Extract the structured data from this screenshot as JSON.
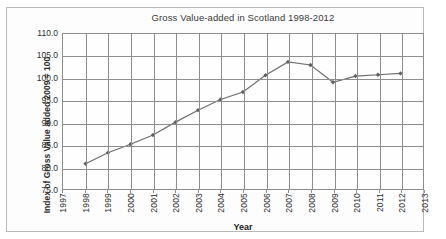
{
  "chart_data": {
    "type": "line",
    "title": "Gross Value-added in Scotland 1998-2012",
    "xlabel": "Year",
    "ylabel": "Index of Gross Value added 2009 = 100",
    "x": [
      1998,
      1999,
      2000,
      2001,
      2002,
      2003,
      2004,
      2005,
      2006,
      2007,
      2008,
      2009,
      2010,
      2011,
      2012
    ],
    "values": [
      80.7,
      83.2,
      85.1,
      87.2,
      90.1,
      92.8,
      95.2,
      96.9,
      100.7,
      103.7,
      103.0,
      99.1,
      100.5,
      100.8,
      101.1
    ],
    "series": [
      {
        "name": "Index of Gross Value added",
        "values": [
          80.7,
          83.2,
          85.1,
          87.2,
          90.1,
          92.8,
          95.2,
          96.9,
          100.7,
          103.7,
          103.0,
          99.1,
          100.5,
          100.8,
          101.1
        ]
      }
    ],
    "xlim": [
      1997,
      2013
    ],
    "ylim": [
      75.0,
      110.0
    ],
    "xticks": [
      1997,
      1998,
      1999,
      2000,
      2001,
      2002,
      2003,
      2004,
      2005,
      2006,
      2007,
      2008,
      2009,
      2010,
      2011,
      2012,
      2013
    ],
    "xtick_labels": [
      "1997",
      "1998",
      "1999",
      "2000",
      "2001",
      "2002",
      "2003",
      "2004",
      "2005",
      "2006",
      "2007",
      "2008",
      "2009",
      "2010",
      "2011",
      "2012",
      "2013"
    ],
    "yticks": [
      75.0,
      80.0,
      85.0,
      90.0,
      95.0,
      100.0,
      105.0,
      110.0
    ],
    "ytick_labels": [
      "75.0",
      "80.0",
      "85.0",
      "90.0",
      "95.0",
      "100.0",
      "105.0",
      "110.0"
    ],
    "grid": true,
    "legend": false,
    "legend_position": "none",
    "marker": "diamond",
    "line_color": "#6e6e6e",
    "marker_color": "#5f5f5f",
    "grid_color": "#8d8d8d",
    "plot_background": "#fefefe"
  }
}
